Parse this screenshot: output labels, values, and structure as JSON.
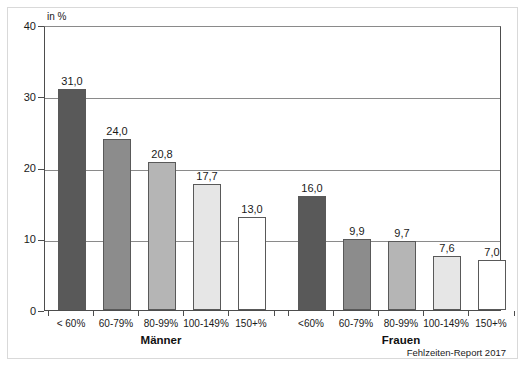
{
  "chart_data": {
    "type": "bar",
    "title": "",
    "subtitle": "",
    "xlabel": "",
    "ylabel": "in %",
    "axis_unit": "in %",
    "ylim": [
      0,
      40
    ],
    "ytick_values": [
      0,
      10,
      20,
      30,
      40
    ],
    "ytick_labels": [
      "0",
      "10",
      "20",
      "30",
      "40"
    ],
    "grid": true,
    "legend_position": "none",
    "categories": [
      "< 60%",
      "60-79%",
      "80-99%",
      "100-149%",
      "150+%"
    ],
    "groups": [
      {
        "name": "Männer",
        "label": "Männer",
        "categories": [
          "< 60%",
          "60-79%",
          "80-99%",
          "100-149%",
          "150+%"
        ],
        "values": [
          31.0,
          24.0,
          20.8,
          17.7,
          13.0
        ],
        "value_labels": [
          "31,0",
          "24,0",
          "20,8",
          "17,7",
          "13,0"
        ],
        "bar_colors": [
          "#595959",
          "#8c8c8c",
          "#b5b5b5",
          "#e6e6e6",
          "#ffffff"
        ]
      },
      {
        "name": "Frauen",
        "label": "Frauen",
        "categories": [
          "<60%",
          "60-79%",
          "80-99%",
          "100-149%",
          "150+%"
        ],
        "values": [
          16.0,
          9.9,
          9.7,
          7.6,
          7.0
        ],
        "value_labels": [
          "16,0",
          "9,9",
          "9,7",
          "7,6",
          "7,0"
        ],
        "bar_colors": [
          "#595959",
          "#8c8c8c",
          "#b5b5b5",
          "#e6e6e6",
          "#ffffff"
        ]
      }
    ],
    "annotations": [
      {
        "name": "source",
        "text": "Fehlzeiten-Report 2017"
      }
    ]
  },
  "source_note": "Fehlzeiten-Report 2017",
  "colors": {
    "axis": "#4d4d4d",
    "grid": "#8a8a8a",
    "text": "#1a1a1a",
    "frame": "#d9d9d9",
    "bar_border": "#595959"
  }
}
